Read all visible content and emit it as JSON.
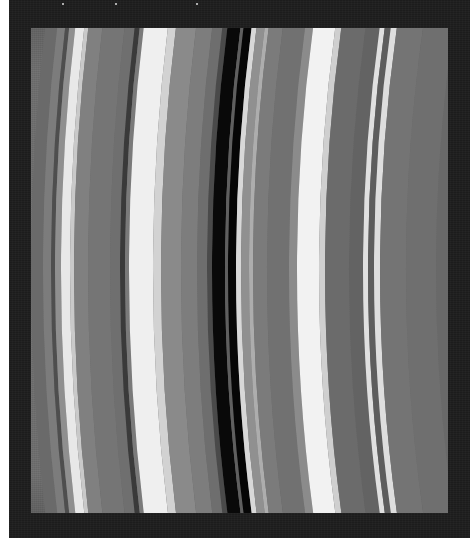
{
  "page": {
    "width": 470,
    "height": 538,
    "background_color": "#ffffff"
  },
  "frame": {
    "name": "photo-border",
    "color": "#1c1c1c",
    "left": 9,
    "top": 0,
    "width": 461,
    "height": 538
  },
  "image": {
    "subject": "planetary-ring-bands",
    "description": "Grayscale close-up of curved planetary ring bands with a prominent dark gap",
    "viewport": {
      "left": 31,
      "top": 28,
      "width": 417,
      "height": 485
    },
    "base_color": "#6d6d6d",
    "curvature": {
      "type": "circular-arc",
      "bulge_direction": "left",
      "bulge_pixels": 22,
      "center_x_offset": 2100,
      "radius_px": 2100
    },
    "stars": [
      {
        "x": 62,
        "y": 3
      },
      {
        "x": 115,
        "y": 3
      },
      {
        "x": 196,
        "y": 3
      }
    ],
    "bands": [
      {
        "name": "outer-dark-gray",
        "offset": 0,
        "width": 12,
        "color": "#6a6a6a"
      },
      {
        "name": "mid-gray-a",
        "offset": 12,
        "width": 8,
        "color": "#7c7c7c"
      },
      {
        "name": "dark-lane-a",
        "offset": 20,
        "width": 4,
        "color": "#4e4e4e"
      },
      {
        "name": "light-gray-a",
        "offset": 24,
        "width": 6,
        "color": "#8f8f8f"
      },
      {
        "name": "bright-band-a",
        "offset": 30,
        "width": 9,
        "color": "#e8e8e8"
      },
      {
        "name": "bright-band-a-edge",
        "offset": 39,
        "width": 4,
        "color": "#c9c9c9"
      },
      {
        "name": "mid-gray-b",
        "offset": 43,
        "width": 14,
        "color": "#808080"
      },
      {
        "name": "gray-plateau-b",
        "offset": 57,
        "width": 22,
        "color": "#757575"
      },
      {
        "name": "gray-plateau-c",
        "offset": 79,
        "width": 10,
        "color": "#6f6f6f"
      },
      {
        "name": "dark-lane-b",
        "offset": 89,
        "width": 5,
        "color": "#3a3a3a"
      },
      {
        "name": "transition-c",
        "offset": 94,
        "width": 4,
        "color": "#7a7a7a"
      },
      {
        "name": "bright-band-b",
        "offset": 98,
        "width": 24,
        "color": "#efefef"
      },
      {
        "name": "bright-band-b-taper",
        "offset": 122,
        "width": 8,
        "color": "#d2d2d2"
      },
      {
        "name": "mid-gray-d",
        "offset": 130,
        "width": 20,
        "color": "#8a8a8a"
      },
      {
        "name": "mid-gray-e",
        "offset": 150,
        "width": 16,
        "color": "#7d7d7d"
      },
      {
        "name": "mid-gray-f",
        "offset": 166,
        "width": 10,
        "color": "#6e6e6e"
      },
      {
        "name": "pre-gap-shadow",
        "offset": 176,
        "width": 5,
        "color": "#4a4a4a"
      },
      {
        "name": "main-gap-black",
        "offset": 181,
        "width": 13,
        "color": "#090909"
      },
      {
        "name": "gap-divider",
        "offset": 194,
        "width": 3,
        "color": "#5f5f5f"
      },
      {
        "name": "inner-gap-black",
        "offset": 197,
        "width": 8,
        "color": "#060606"
      },
      {
        "name": "post-gap-bright",
        "offset": 205,
        "width": 5,
        "color": "#d8d8d8"
      },
      {
        "name": "post-gap-gray",
        "offset": 210,
        "width": 8,
        "color": "#909090"
      },
      {
        "name": "ridge-a",
        "offset": 218,
        "width": 4,
        "color": "#adadad"
      },
      {
        "name": "mid-gray-g",
        "offset": 222,
        "width": 14,
        "color": "#7b7b7b"
      },
      {
        "name": "mid-gray-h",
        "offset": 236,
        "width": 22,
        "color": "#717171"
      },
      {
        "name": "pre-bright-shade",
        "offset": 258,
        "width": 8,
        "color": "#8b8b8b"
      },
      {
        "name": "bright-band-c",
        "offset": 266,
        "width": 22,
        "color": "#f2f2f2"
      },
      {
        "name": "bright-band-c-taper",
        "offset": 288,
        "width": 6,
        "color": "#cfcfcf"
      },
      {
        "name": "dark-gray-i",
        "offset": 294,
        "width": 24,
        "color": "#6b6b6b"
      },
      {
        "name": "dark-gray-j",
        "offset": 318,
        "width": 14,
        "color": "#636363"
      },
      {
        "name": "thin-bright-d",
        "offset": 332,
        "width": 5,
        "color": "#e0e0e0"
      },
      {
        "name": "thin-dark-k",
        "offset": 337,
        "width": 6,
        "color": "#5d5d5d"
      },
      {
        "name": "thin-bright-e",
        "offset": 343,
        "width": 6,
        "color": "#dedede"
      },
      {
        "name": "gray-plateau-l",
        "offset": 349,
        "width": 26,
        "color": "#747474"
      },
      {
        "name": "gray-plateau-m",
        "offset": 375,
        "width": 30,
        "color": "#6f6f6f"
      },
      {
        "name": "edge-gray-n",
        "offset": 405,
        "width": 60,
        "color": "#696969"
      }
    ]
  }
}
